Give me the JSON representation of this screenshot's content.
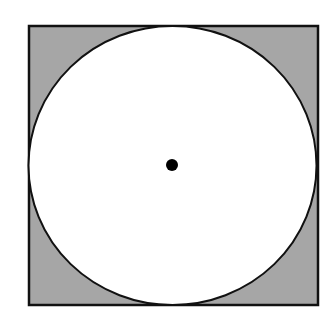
{
  "diagram": {
    "colors": {
      "background": "#ffffff",
      "square_fill": "#a6a6a6",
      "circle_fill": "#ffffff",
      "stroke": "#111111",
      "center_dot": "#000000"
    },
    "square": {
      "x": 29,
      "y": 26,
      "width": 289,
      "height": 279,
      "stroke_width": 2.5
    },
    "circle": {
      "cx": 172.5,
      "cy": 165.5,
      "rx": 144,
      "ry": 139.5,
      "stroke_width": 2
    },
    "center_point": {
      "cx": 172,
      "cy": 165,
      "r": 6
    }
  }
}
